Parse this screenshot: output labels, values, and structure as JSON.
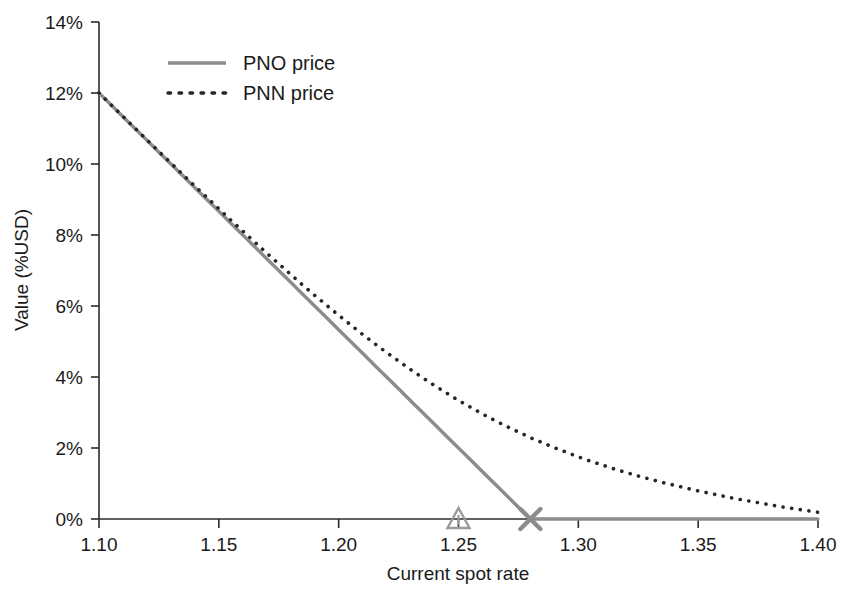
{
  "chart_data": {
    "type": "line",
    "title": "",
    "xlabel": "Current spot rate",
    "ylabel": "Value (%USD)",
    "xlim": [
      1.1,
      1.4
    ],
    "ylim": [
      0,
      14
    ],
    "grid": false,
    "legend_position": "top-left-inside",
    "x_ticks": [
      "1.10",
      "1.15",
      "1.20",
      "1.25",
      "1.30",
      "1.35",
      "1.40"
    ],
    "x_tick_values": [
      1.1,
      1.15,
      1.2,
      1.25,
      1.3,
      1.35,
      1.4
    ],
    "y_ticks": [
      "0%",
      "2%",
      "4%",
      "6%",
      "8%",
      "10%",
      "12%",
      "14%"
    ],
    "y_tick_values": [
      0,
      2,
      4,
      6,
      8,
      10,
      12,
      14
    ],
    "x": [
      1.1,
      1.105,
      1.11,
      1.115,
      1.12,
      1.125,
      1.13,
      1.135,
      1.14,
      1.145,
      1.15,
      1.155,
      1.16,
      1.165,
      1.17,
      1.175,
      1.18,
      1.185,
      1.19,
      1.195,
      1.2,
      1.205,
      1.21,
      1.215,
      1.22,
      1.225,
      1.23,
      1.235,
      1.24,
      1.245,
      1.25,
      1.255,
      1.26,
      1.265,
      1.27,
      1.275,
      1.28,
      1.285,
      1.29,
      1.295,
      1.3,
      1.305,
      1.31,
      1.315,
      1.32,
      1.325,
      1.33,
      1.335,
      1.34,
      1.345,
      1.35,
      1.355,
      1.36,
      1.365,
      1.37,
      1.375,
      1.38,
      1.385,
      1.39,
      1.395,
      1.4
    ],
    "series": [
      {
        "name": "PNO price",
        "style": "solid",
        "color": "#8c8c8c",
        "values": [
          12.0,
          11.67,
          11.33,
          11.0,
          10.67,
          10.33,
          10.0,
          9.67,
          9.33,
          9.0,
          8.67,
          8.33,
          8.0,
          7.67,
          7.33,
          7.0,
          6.67,
          6.33,
          6.0,
          5.67,
          5.33,
          5.0,
          4.67,
          4.33,
          4.0,
          3.67,
          3.33,
          3.0,
          2.67,
          2.33,
          2.0,
          1.67,
          1.33,
          1.0,
          0.67,
          0.33,
          0.0,
          0.0,
          0.0,
          0.0,
          0.0,
          0.0,
          0.0,
          0.0,
          0.0,
          0.0,
          0.0,
          0.0,
          0.0,
          0.0,
          0.0,
          0.0,
          0.0,
          0.0,
          0.0,
          0.0,
          0.0,
          0.0,
          0.0,
          0.0,
          0.0
        ]
      },
      {
        "name": "PNN price",
        "style": "dotted",
        "color": "#262626",
        "values": [
          12.0,
          11.67,
          11.34,
          11.01,
          10.68,
          10.35,
          10.03,
          9.7,
          9.38,
          9.06,
          8.74,
          8.42,
          8.11,
          7.8,
          7.49,
          7.19,
          6.89,
          6.59,
          6.3,
          6.02,
          5.74,
          5.47,
          5.2,
          4.94,
          4.69,
          4.45,
          4.21,
          3.98,
          3.76,
          3.55,
          3.34,
          3.15,
          2.96,
          2.78,
          2.61,
          2.45,
          2.29,
          2.15,
          2.01,
          1.88,
          1.75,
          1.63,
          1.52,
          1.41,
          1.31,
          1.21,
          1.12,
          1.03,
          0.95,
          0.87,
          0.79,
          0.72,
          0.65,
          0.58,
          0.52,
          0.46,
          0.4,
          0.34,
          0.29,
          0.24,
          0.19
        ]
      }
    ],
    "markers": [
      {
        "name": "triangle-marker",
        "shape": "triangle",
        "x": 1.25,
        "y": 0,
        "color": "#9a9a9a"
      },
      {
        "name": "cross-marker",
        "shape": "x",
        "x": 1.28,
        "y": 0,
        "color": "#8c8c8c"
      }
    ]
  },
  "legend": {
    "entries": [
      {
        "label": "PNO price"
      },
      {
        "label": "PNN price"
      }
    ]
  }
}
